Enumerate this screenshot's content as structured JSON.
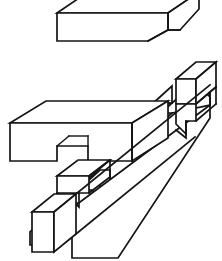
{
  "document": {
    "kind": "technical-line-drawing",
    "subject": "isometric joinery / interlocking notched bar assembly",
    "background_color": "#ffffff",
    "line_color": "#151515",
    "width": 222,
    "height": 261,
    "visible_text": [],
    "labels": [],
    "parts": [
      {
        "id": "top-bar",
        "name": "Upper notched bar",
        "description": "Horizontal rectangular bar seen in oblique projection, top face partially cropped by the image edge, with a rectangular step notch cut into the lower right of its front face."
      },
      {
        "id": "front-bar",
        "name": "Front horizontal bar",
        "description": "Large horizontal bar in the lower left half with a rectangular notch cut up into its bottom face near the middle-right."
      },
      {
        "id": "diagonal-bar",
        "name": "Receding diagonal bar",
        "description": "Long bar receding from the lower left to the upper right, passing behind the front bar, carrying two square tenon blocks and two V notches."
      },
      {
        "id": "upper-cube",
        "name": "Upper tenon block",
        "description": "Cube-shaped tenon block at the far upper right end of the diagonal bar."
      },
      {
        "id": "lower-cube",
        "name": "Lower end block",
        "description": "Cube-shaped block at the near lower left end of the diagonal bar."
      },
      {
        "id": "middle-tenon",
        "name": "Middle tenon block",
        "description": "Small square tenon block standing on the diagonal bar, beneath the front bar notch."
      }
    ],
    "geometry": {
      "top_bar": {
        "front_face": "57,12 168,12 168,30 148,30 148,40 57,40",
        "top_face": "57,12 89,-10 200,-10 168,12",
        "right_face": "168,12 200,-10 200,8 180,30 168,30",
        "notch_diagonal": "148,40 168,30",
        "notch_side": "168,30 180,30"
      },
      "front_bar": {
        "top_face": "10,122 46,100 168,100 132,122",
        "front_face": "10,122 132,122 132,160 88,160 88,146 57,146 57,160 10,160",
        "right_face": "132,122 168,100 168,136 132,160"
      },
      "diagonal_bar": {
        "path": "runs lower-left (x=30,y=238) to upper-right (x=210,y=70)"
      },
      "cubes": {
        "upper": "x 172..210, y 62..105",
        "lower": "x 32..72, y 208..250",
        "middle": "x 78..110, y 166..192"
      }
    }
  }
}
